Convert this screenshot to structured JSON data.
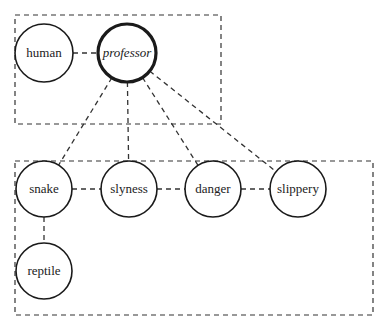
{
  "diagram": {
    "groups": [
      {
        "id": "top-group",
        "x": 15,
        "y": 15,
        "w": 206,
        "h": 109
      },
      {
        "id": "bottom-group",
        "x": 15,
        "y": 161,
        "w": 358,
        "h": 154
      }
    ],
    "nodes": [
      {
        "id": "human",
        "label": "human",
        "cx": 44,
        "cy": 53,
        "r": 29,
        "emphasis": false
      },
      {
        "id": "professor",
        "label": "professor",
        "cx": 127,
        "cy": 53,
        "r": 29,
        "emphasis": true
      },
      {
        "id": "snake",
        "label": "snake",
        "cx": 44,
        "cy": 189,
        "r": 28,
        "emphasis": false
      },
      {
        "id": "slyness",
        "label": "slyness",
        "cx": 129,
        "cy": 189,
        "r": 28,
        "emphasis": false
      },
      {
        "id": "danger",
        "label": "danger",
        "cx": 213,
        "cy": 189,
        "r": 28,
        "emphasis": false
      },
      {
        "id": "slippery",
        "label": "slippery",
        "cx": 298,
        "cy": 189,
        "r": 28,
        "emphasis": false
      },
      {
        "id": "reptile",
        "label": "reptile",
        "cx": 44,
        "cy": 271,
        "r": 28,
        "emphasis": false
      }
    ],
    "edges": [
      {
        "from": "human",
        "to": "professor"
      },
      {
        "from": "professor",
        "to": "snake"
      },
      {
        "from": "professor",
        "to": "slyness"
      },
      {
        "from": "professor",
        "to": "danger"
      },
      {
        "from": "professor",
        "to": "slippery"
      },
      {
        "from": "snake",
        "to": "slyness"
      },
      {
        "from": "slyness",
        "to": "danger"
      },
      {
        "from": "danger",
        "to": "slippery"
      },
      {
        "from": "snake",
        "to": "reptile"
      }
    ],
    "colors": {
      "stroke": "#1a1a1a",
      "dash": "#333333",
      "background": "#ffffff"
    }
  }
}
